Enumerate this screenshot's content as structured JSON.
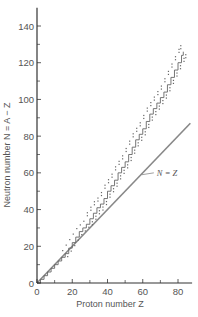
{
  "chart_data": {
    "type": "line",
    "title": "",
    "xlabel": "Proton number Z",
    "ylabel": "Neutron number N = A − Z",
    "xlim": [
      0,
      88
    ],
    "ylim": [
      0,
      150
    ],
    "xticks": [
      0,
      20,
      40,
      60,
      80
    ],
    "xminor": [
      10,
      30,
      50,
      70
    ],
    "yticks": [
      0,
      20,
      40,
      60,
      80,
      100,
      120,
      140
    ],
    "yminor": [
      10,
      30,
      50,
      70,
      90,
      110,
      130
    ],
    "grid": false,
    "legend": "none",
    "series": [
      {
        "name": "N = Z",
        "style": "solid-line",
        "color": "#888888",
        "x": [
          0,
          87
        ],
        "y": [
          0,
          87
        ]
      },
      {
        "name": "stable nuclei (staircase band)",
        "style": "step-with-dots",
        "color": "#666666",
        "x": [
          0,
          2,
          4,
          6,
          8,
          10,
          12,
          14,
          16,
          18,
          20,
          22,
          24,
          26,
          28,
          30,
          32,
          34,
          36,
          38,
          40,
          42,
          44,
          46,
          48,
          50,
          52,
          54,
          56,
          58,
          60,
          62,
          64,
          66,
          68,
          70,
          72,
          74,
          76,
          78,
          80,
          82,
          83
        ],
        "y": [
          0,
          2,
          4,
          6,
          8,
          10,
          12,
          14,
          16,
          19,
          22,
          25,
          28,
          30,
          32,
          35,
          38,
          41,
          43,
          46,
          50,
          53,
          56,
          60,
          63,
          66,
          70,
          74,
          78,
          81,
          84,
          88,
          92,
          95,
          98,
          101,
          104,
          108,
          112,
          116,
          120,
          124,
          126
        ]
      }
    ],
    "annotations": [
      {
        "text": "N = Z",
        "x": 68,
        "y": 60,
        "arrow_to": [
          59,
          59
        ]
      }
    ]
  }
}
